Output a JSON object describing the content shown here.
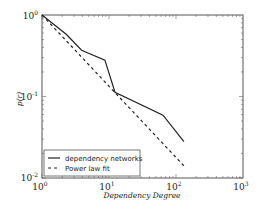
{
  "chart_data": {
    "type": "line",
    "title": "",
    "xlabel": "Dependency Degree",
    "ylabel": "p(r)",
    "xscale": "log",
    "yscale": "log",
    "xlim": [
      1,
      1000
    ],
    "ylim": [
      0.01,
      1
    ],
    "grid": false,
    "legend_position": "lower left",
    "x_ticks": [
      {
        "base": "10",
        "exp": "0"
      },
      {
        "base": "10",
        "exp": "1"
      },
      {
        "base": "10",
        "exp": "2"
      },
      {
        "base": "10",
        "exp": "3"
      }
    ],
    "y_ticks": [
      {
        "base": "10",
        "exp": "0"
      },
      {
        "base": "10",
        "exp": "-1"
      },
      {
        "base": "10",
        "exp": "-2"
      }
    ],
    "series": [
      {
        "name": "dependency networks",
        "style": "solid",
        "x": [
          1,
          2.3,
          3.9,
          8.7,
          12.3,
          64,
          131
        ],
        "y": [
          1,
          0.58,
          0.37,
          0.28,
          0.113,
          0.059,
          0.028
        ]
      },
      {
        "name": "Power law fit",
        "style": "dashed",
        "x": [
          1,
          136
        ],
        "y": [
          1,
          0.0137
        ]
      }
    ]
  },
  "legend": {
    "items": [
      {
        "label": "dependency networks"
      },
      {
        "label": "Power law fit"
      }
    ]
  },
  "axes": {
    "xlabel": "Dependency Degree",
    "ylabel": "p(r)"
  }
}
